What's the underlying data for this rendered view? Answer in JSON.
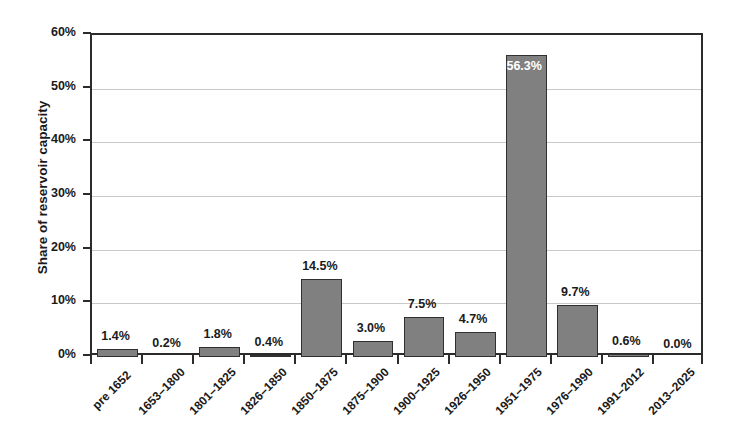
{
  "chart_data": {
    "type": "bar",
    "title": "",
    "subtitle": "",
    "xlabel": "",
    "ylabel": "Share of reservoir capacity",
    "categories": [
      "pre 1652",
      "1653–1800",
      "1801–1825",
      "1826–1850",
      "1850–1875",
      "1875–1900",
      "1900–1925",
      "1926–1950",
      "1951–1975",
      "1976–1990",
      "1991–2012",
      "2013–2025"
    ],
    "values": [
      1.4,
      0.2,
      1.8,
      0.4,
      14.5,
      3.0,
      7.5,
      4.7,
      56.3,
      9.7,
      0.6,
      0.0
    ],
    "data_labels": [
      "1.4%",
      "0.2%",
      "1.8%",
      "0.4%",
      "14.5%",
      "3.0%",
      "7.5%",
      "4.7%",
      "56.3%",
      "9.7%",
      "0.6%",
      "0.0%"
    ],
    "ylim": [
      0,
      60
    ],
    "ytick_values": [
      0,
      10,
      20,
      30,
      40,
      50,
      60
    ],
    "ytick_labels": [
      "0%",
      "10%",
      "20%",
      "30%",
      "40%",
      "50%",
      "60%"
    ],
    "grid": "horizontal",
    "legend": "none",
    "bar_color": "#808080",
    "bar_edge_color": "#303030",
    "axis_color": "#2b2b2b",
    "gridline_color": "#c9c9c9",
    "label_inside_index": 8
  },
  "background_artifacts": [
    {
      "text": "vertical stripes of bleed-through text",
      "line": "l .,  ,     , ,  n  ."
    },
    {
      "text": "bleed line 2",
      "line": "d b  u  d d  ,  m  n  ."
    }
  ]
}
